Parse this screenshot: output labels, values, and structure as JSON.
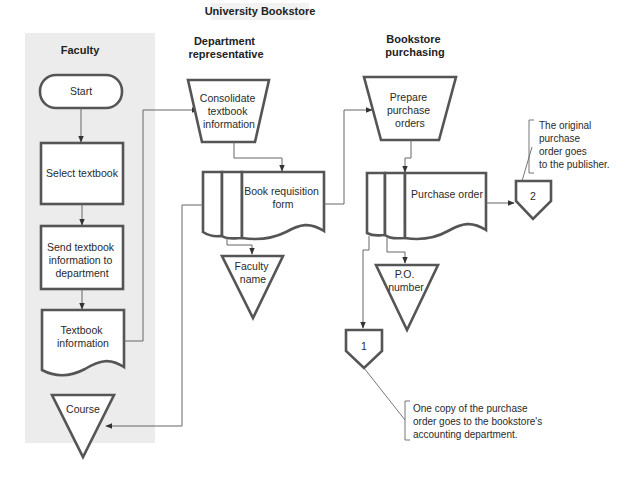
{
  "title": "University Bookstore",
  "lanes": [
    {
      "id": "faculty",
      "title_lines": [
        "Faculty"
      ]
    },
    {
      "id": "department",
      "title_lines": [
        "Department",
        "representative"
      ]
    },
    {
      "id": "purchasing",
      "title_lines": [
        "Bookstore",
        "purchasing"
      ]
    }
  ],
  "nodes": {
    "start": {
      "type": "terminal",
      "lines": [
        "Start"
      ]
    },
    "select_textbook": {
      "type": "process",
      "lines": [
        "Select textbook"
      ]
    },
    "send_info": {
      "type": "process",
      "lines": [
        "Send textbook",
        "information to",
        "department"
      ]
    },
    "textbook_info": {
      "type": "document",
      "lines": [
        "Textbook",
        "information"
      ]
    },
    "course": {
      "type": "file",
      "lines": [
        "Course"
      ]
    },
    "consolidate": {
      "type": "manual-operation",
      "lines": [
        "Consolidate",
        "textbook",
        "information"
      ]
    },
    "book_requisition": {
      "type": "multi-document",
      "lines": [
        "Book requisition",
        "form"
      ]
    },
    "faculty_name": {
      "type": "file",
      "lines": [
        "Faculty",
        "name"
      ]
    },
    "prepare_po": {
      "type": "manual-operation",
      "lines": [
        "Prepare",
        "purchase",
        "orders"
      ]
    },
    "purchase_order": {
      "type": "multi-document",
      "lines": [
        "Purchase order"
      ]
    },
    "po_number": {
      "type": "file",
      "lines": [
        "P.O.",
        "number"
      ]
    },
    "connector_1": {
      "type": "off-page-connector",
      "lines": [
        "1"
      ]
    },
    "connector_2": {
      "type": "off-page-connector",
      "lines": [
        "2"
      ]
    }
  },
  "annotations": {
    "note_publisher": {
      "lines": [
        "The original",
        "purchase",
        "order goes",
        "to the publisher."
      ]
    },
    "note_accounting": {
      "lines": [
        "One copy of the purchase",
        "order goes to the bookstore's",
        "accounting department."
      ]
    }
  },
  "colors": {
    "lane_background": "#ececec",
    "stroke": "#555555"
  }
}
